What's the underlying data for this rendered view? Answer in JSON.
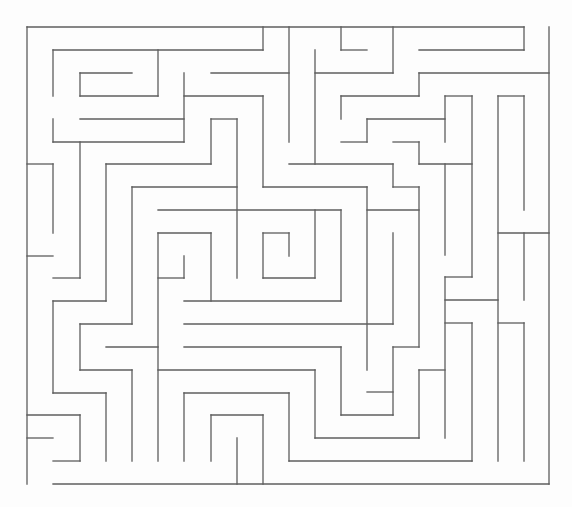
{
  "maze": {
    "title": "Maze puzzle",
    "canvas": {
      "width": 572,
      "height": 507
    },
    "grid": {
      "cols": 20,
      "rows": 20,
      "left": 27,
      "top": 27,
      "right": 549,
      "bottom": 484
    },
    "colors": {
      "background": "#fdfdfd",
      "wall": "#5e5e5e"
    },
    "openings": {
      "entrance": {
        "side": "top",
        "x1": 524,
        "x2": 549,
        "y": 27
      },
      "exit": {
        "side": "bottom",
        "x1": 27,
        "x2": 53,
        "y": 484
      }
    },
    "walls": [
      [
        27,
        27,
        524,
        27
      ],
      [
        524,
        27,
        524,
        50
      ],
      [
        549,
        27,
        549,
        484
      ],
      [
        53,
        484,
        549,
        484
      ],
      [
        27,
        27,
        27,
        484
      ],
      [
        53,
        50,
        263,
        50
      ],
      [
        263,
        27,
        263,
        50
      ],
      [
        53,
        50,
        53,
        96
      ],
      [
        53,
        119,
        53,
        142
      ],
      [
        80,
        73,
        132,
        73
      ],
      [
        80,
        73,
        80,
        96
      ],
      [
        80,
        96,
        158,
        96
      ],
      [
        158,
        50,
        158,
        96
      ],
      [
        184,
        73,
        184,
        142
      ],
      [
        184,
        96,
        263,
        96
      ],
      [
        263,
        96,
        263,
        187
      ],
      [
        263,
        187,
        367,
        187
      ],
      [
        367,
        187,
        367,
        370
      ],
      [
        211,
        73,
        289,
        73
      ],
      [
        289,
        27,
        289,
        142
      ],
      [
        80,
        119,
        184,
        119
      ],
      [
        53,
        142,
        184,
        142
      ],
      [
        80,
        142,
        80,
        278
      ],
      [
        53,
        278,
        80,
        278
      ],
      [
        27,
        164,
        53,
        164
      ],
      [
        53,
        164,
        53,
        233
      ],
      [
        27,
        256,
        53,
        256
      ],
      [
        106,
        164,
        211,
        164
      ],
      [
        211,
        119,
        211,
        164
      ],
      [
        211,
        119,
        237,
        119
      ],
      [
        237,
        119,
        237,
        278
      ],
      [
        106,
        164,
        106,
        301
      ],
      [
        53,
        301,
        106,
        301
      ],
      [
        53,
        301,
        53,
        393
      ],
      [
        53,
        393,
        106,
        393
      ],
      [
        106,
        393,
        106,
        461
      ],
      [
        132,
        187,
        237,
        187
      ],
      [
        132,
        187,
        132,
        324
      ],
      [
        80,
        324,
        132,
        324
      ],
      [
        80,
        324,
        80,
        370
      ],
      [
        80,
        370,
        132,
        370
      ],
      [
        132,
        370,
        132,
        461
      ],
      [
        158,
        210,
        341,
        210
      ],
      [
        341,
        210,
        341,
        301
      ],
      [
        184,
        301,
        341,
        301
      ],
      [
        315,
        210,
        315,
        278
      ],
      [
        263,
        278,
        315,
        278
      ],
      [
        263,
        233,
        263,
        278
      ],
      [
        263,
        233,
        289,
        233
      ],
      [
        289,
        233,
        289,
        256
      ],
      [
        158,
        233,
        211,
        233
      ],
      [
        211,
        233,
        211,
        301
      ],
      [
        158,
        233,
        158,
        461
      ],
      [
        184,
        256,
        184,
        278
      ],
      [
        158,
        278,
        184,
        278
      ],
      [
        106,
        347,
        158,
        347
      ],
      [
        184,
        324,
        393,
        324
      ],
      [
        184,
        347,
        341,
        347
      ],
      [
        158,
        370,
        315,
        370
      ],
      [
        184,
        393,
        289,
        393
      ],
      [
        184,
        393,
        184,
        461
      ],
      [
        289,
        393,
        289,
        461
      ],
      [
        289,
        461,
        472,
        461
      ],
      [
        211,
        415,
        263,
        415
      ],
      [
        211,
        415,
        211,
        461
      ],
      [
        263,
        415,
        263,
        484
      ],
      [
        237,
        438,
        237,
        484
      ],
      [
        27,
        415,
        80,
        415
      ],
      [
        80,
        415,
        80,
        461
      ],
      [
        53,
        461,
        80,
        461
      ],
      [
        27,
        438,
        53,
        438
      ],
      [
        315,
        370,
        315,
        438
      ],
      [
        315,
        438,
        419,
        438
      ],
      [
        419,
        370,
        419,
        438
      ],
      [
        419,
        370,
        445,
        370
      ],
      [
        341,
        347,
        341,
        415
      ],
      [
        341,
        415,
        393,
        415
      ],
      [
        393,
        347,
        393,
        415
      ],
      [
        367,
        392,
        393,
        392
      ],
      [
        393,
        347,
        419,
        347
      ],
      [
        393,
        233,
        393,
        324
      ],
      [
        367,
        210,
        419,
        210
      ],
      [
        289,
        164,
        393,
        164
      ],
      [
        393,
        164,
        393,
        187
      ],
      [
        393,
        187,
        419,
        187
      ],
      [
        419,
        187,
        419,
        347
      ],
      [
        315,
        50,
        315,
        164
      ],
      [
        315,
        73,
        393,
        73
      ],
      [
        393,
        27,
        393,
        73
      ],
      [
        341,
        27,
        341,
        50
      ],
      [
        341,
        50,
        367,
        50
      ],
      [
        419,
        50,
        524,
        50
      ],
      [
        419,
        73,
        549,
        73
      ],
      [
        419,
        73,
        419,
        96
      ],
      [
        341,
        96,
        419,
        96
      ],
      [
        341,
        96,
        341,
        119
      ],
      [
        367,
        119,
        445,
        119
      ],
      [
        367,
        119,
        367,
        142
      ],
      [
        341,
        142,
        367,
        142
      ],
      [
        445,
        96,
        445,
        142
      ],
      [
        445,
        96,
        472,
        96
      ],
      [
        472,
        96,
        472,
        277
      ],
      [
        445,
        277,
        472,
        277
      ],
      [
        393,
        142,
        419,
        142
      ],
      [
        419,
        142,
        419,
        164
      ],
      [
        419,
        164,
        472,
        164
      ],
      [
        445,
        164,
        445,
        255
      ],
      [
        445,
        277,
        445,
        438
      ],
      [
        445,
        300,
        498,
        300
      ],
      [
        498,
        96,
        524,
        96
      ],
      [
        498,
        96,
        498,
        461
      ],
      [
        524,
        96,
        524,
        210
      ],
      [
        498,
        233,
        549,
        233
      ],
      [
        524,
        233,
        524,
        300
      ],
      [
        445,
        323,
        472,
        323
      ],
      [
        472,
        323,
        472,
        461
      ],
      [
        498,
        323,
        524,
        323
      ],
      [
        524,
        323,
        524,
        461
      ]
    ]
  }
}
